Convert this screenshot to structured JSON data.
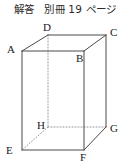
{
  "header": {
    "text": "解答　別冊 19 ページ",
    "parts": {
      "answer_label": "解答",
      "booklet_label": "別冊",
      "page_number": "19",
      "page_unit": "ページ"
    }
  },
  "figure": {
    "name": "rectangular-prism-diagram",
    "type": "cuboid",
    "stroke_color": "#4a4a4a",
    "hidden_edge_color": "#8a8a8a",
    "label_color": "#1a1a1a",
    "vertices": [
      {
        "id": "A",
        "label": "A",
        "x": 22,
        "y": 51,
        "label_x": 7,
        "label_y": 44
      },
      {
        "id": "B",
        "label": "B",
        "x": 84,
        "y": 51,
        "label_x": 76,
        "label_y": 53
      },
      {
        "id": "C",
        "label": "C",
        "x": 106,
        "y": 35,
        "label_x": 110,
        "label_y": 27
      },
      {
        "id": "D",
        "label": "D",
        "x": 48,
        "y": 35,
        "label_x": 43,
        "label_y": 22
      },
      {
        "id": "E",
        "label": "E",
        "x": 22,
        "y": 150,
        "label_x": 6,
        "label_y": 145
      },
      {
        "id": "F",
        "label": "F",
        "x": 84,
        "y": 150,
        "label_x": 80,
        "label_y": 152
      },
      {
        "id": "G",
        "label": "G",
        "x": 106,
        "y": 127,
        "label_x": 110,
        "label_y": 123
      },
      {
        "id": "H",
        "label": "H",
        "x": 48,
        "y": 127,
        "label_x": 37,
        "label_y": 120
      }
    ],
    "visible_edges": [
      {
        "from": "A",
        "to": "B"
      },
      {
        "from": "B",
        "to": "F"
      },
      {
        "from": "F",
        "to": "E"
      },
      {
        "from": "E",
        "to": "A"
      },
      {
        "from": "A",
        "to": "D"
      },
      {
        "from": "D",
        "to": "C"
      },
      {
        "from": "C",
        "to": "B"
      },
      {
        "from": "C",
        "to": "G"
      },
      {
        "from": "G",
        "to": "F"
      }
    ],
    "hidden_edges": [
      {
        "from": "D",
        "to": "H"
      },
      {
        "from": "H",
        "to": "G"
      },
      {
        "from": "H",
        "to": "E"
      }
    ]
  }
}
